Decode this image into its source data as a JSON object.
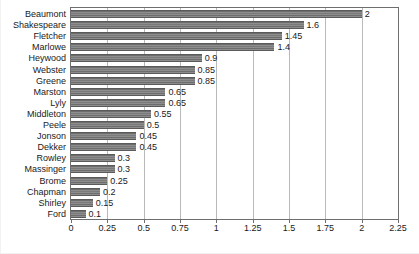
{
  "chart_data": {
    "type": "bar",
    "orientation": "horizontal",
    "title": "",
    "xlabel": "",
    "ylabel": "",
    "xlim": [
      0,
      2.25
    ],
    "xticks": [
      "0",
      "0.25",
      "0.5",
      "0.75",
      "1",
      "1.25",
      "1.5",
      "1.75",
      "2",
      "2.25"
    ],
    "xtick_values": [
      0,
      0.25,
      0.5,
      0.75,
      1,
      1.25,
      1.5,
      1.75,
      2,
      2.25
    ],
    "grid": true,
    "grid_axis": "x",
    "legend": false,
    "categories": [
      "Beaumont",
      "Shakespeare",
      "Fletcher",
      "Marlowe",
      "Heywood",
      "Webster",
      "Greene",
      "Marston",
      "Lyly",
      "Middleton",
      "Peele",
      "Jonson",
      "Dekker",
      "Rowley",
      "Massinger",
      "Brome",
      "Chapman",
      "Shirley",
      "Ford"
    ],
    "values": [
      2,
      1.6,
      1.45,
      1.4,
      0.9,
      0.85,
      0.85,
      0.65,
      0.65,
      0.55,
      0.5,
      0.45,
      0.45,
      0.3,
      0.3,
      0.25,
      0.2,
      0.15,
      0.1
    ],
    "value_labels": [
      "2",
      "1.6",
      "1.45",
      "1.4",
      "0.9",
      "0.85",
      "0.85",
      "0.65",
      "0.65",
      "0.55",
      "0.5",
      "0.45",
      "0.45",
      "0.3",
      "0.3",
      "0.25",
      "0.2",
      "0.15",
      "0.1"
    ],
    "bar_color": "#808080",
    "grid_color": "#b9b9b9",
    "frame_color": "#6e6e6e",
    "text_color": "#1a1a1a"
  }
}
